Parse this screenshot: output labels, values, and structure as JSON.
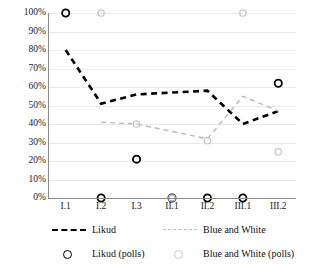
{
  "chart_data": {
    "type": "line",
    "title": "",
    "xlabel": "",
    "ylabel": "",
    "ylim": [
      0,
      100
    ],
    "ytick_format": "percent",
    "grid": true,
    "legend_position": "bottom",
    "categories": [
      "I.1",
      "I.2",
      "I.3",
      "II.1",
      "II.2",
      "III.1",
      "III.2"
    ],
    "ytick_labels": [
      "100%",
      "90%",
      "80%",
      "70%",
      "60%",
      "50%",
      "40%",
      "30%",
      "20%",
      "10%",
      "0%"
    ],
    "ytick_values": [
      100,
      90,
      80,
      70,
      60,
      50,
      40,
      30,
      20,
      10,
      0
    ],
    "series": [
      {
        "name": "Likud",
        "style": "dashed-line",
        "color": "#000000",
        "values": [
          80,
          51,
          56,
          57,
          58,
          40,
          47
        ]
      },
      {
        "name": "Blue and White",
        "style": "dashed-line",
        "color": "#b9b9b9",
        "values": [
          null,
          41,
          40,
          36,
          32,
          55,
          47
        ]
      },
      {
        "name": "Likud (polls)",
        "style": "scatter-open-circle",
        "color": "#000000",
        "values": [
          100,
          0,
          21,
          0,
          0,
          0,
          62
        ]
      },
      {
        "name": "Blue and White (polls)",
        "style": "scatter-open-circle",
        "color": "#c9c9c9",
        "values": [
          null,
          100,
          40,
          0,
          31,
          100,
          25
        ]
      }
    ],
    "legend": [
      {
        "label": "Likud",
        "marker": "dashed-line",
        "color": "#000000"
      },
      {
        "label": "Blue and White",
        "marker": "dashed-line",
        "color": "#b9b9b9"
      },
      {
        "label": "Likud (polls)",
        "marker": "open-circle",
        "color": "#000000"
      },
      {
        "label": "Blue and White (polls)",
        "marker": "open-circle",
        "color": "#c9c9c9"
      }
    ]
  }
}
